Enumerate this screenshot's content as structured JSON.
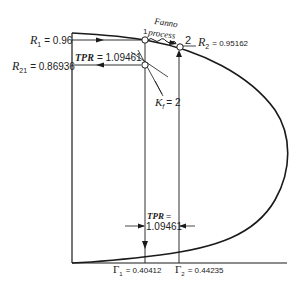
{
  "diagram": {
    "type": "thermodynamic-curve",
    "colors": {
      "line": "#1a1a1a",
      "background": "#ffffff"
    },
    "labels": {
      "r1_sym": "R",
      "r1_sub": "1",
      "r1_val": "= 0.96",
      "r21_sym": "R",
      "r21_sub": "21",
      "r21_val": "= 0.86936",
      "r2_sym": "R",
      "r2_sub": "2",
      "r2_val": "= 0.95162",
      "tpr_top_sym": "TPR",
      "tpr_top_val": "= 1.09461",
      "fanno_line1": "Fanno",
      "fanno_line2": "process",
      "point1": "1",
      "point2": "2",
      "kf_sym": "K",
      "kf_sub": "f",
      "kf_val": "= 2",
      "tpr_bottom_sym": "TPR",
      "tpr_bottom_eq": "=",
      "tpr_bottom_val": "1.09461",
      "gamma1_sym": "Γ",
      "gamma1_sub": "1",
      "gamma1_val": "= 0.40412",
      "gamma2_sym": "Γ",
      "gamma2_sub": "2",
      "gamma2_val": "= 0.44235"
    },
    "values": {
      "R1": 0.96,
      "R21": 0.86936,
      "R2": 0.95162,
      "TPR": 1.09461,
      "Kf": 2,
      "Gamma1": 0.40412,
      "Gamma2": 0.44235
    }
  }
}
